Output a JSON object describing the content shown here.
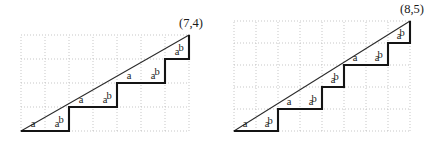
{
  "figure": {
    "background_color": "#ffffff",
    "ink_color": "#1a1a1a",
    "grid_color": "#b9b9b9",
    "panels": [
      {
        "id": "left",
        "corner_label": "(7,4)",
        "grid_cols": 7,
        "grid_rows": 4,
        "origin_x": 21,
        "origin_y": 131,
        "cell_w": 24,
        "cell_h": 24,
        "path_word": "aabaabaabab",
        "steps": [
          {
            "label": "a",
            "dir": "right"
          },
          {
            "label": "a",
            "dir": "right"
          },
          {
            "label": "b",
            "dir": "up"
          },
          {
            "label": "a",
            "dir": "right"
          },
          {
            "label": "a",
            "dir": "right"
          },
          {
            "label": "b",
            "dir": "up"
          },
          {
            "label": "a",
            "dir": "right"
          },
          {
            "label": "a",
            "dir": "right"
          },
          {
            "label": "b",
            "dir": "up"
          },
          {
            "label": "a",
            "dir": "right"
          },
          {
            "label": "b",
            "dir": "up"
          }
        ]
      },
      {
        "id": "right",
        "corner_label": "(8,5)",
        "grid_cols": 8,
        "grid_rows": 5,
        "origin_x": 18,
        "origin_y": 131,
        "cell_w": 22,
        "cell_h": 22,
        "path_word": "aabaababaabab",
        "steps": [
          {
            "label": "a",
            "dir": "right"
          },
          {
            "label": "a",
            "dir": "right"
          },
          {
            "label": "b",
            "dir": "up"
          },
          {
            "label": "a",
            "dir": "right"
          },
          {
            "label": "a",
            "dir": "right"
          },
          {
            "label": "b",
            "dir": "up"
          },
          {
            "label": "a",
            "dir": "right"
          },
          {
            "label": "b",
            "dir": "up"
          },
          {
            "label": "a",
            "dir": "right"
          },
          {
            "label": "a",
            "dir": "right"
          },
          {
            "label": "b",
            "dir": "up"
          },
          {
            "label": "a",
            "dir": "right"
          },
          {
            "label": "b",
            "dir": "up"
          }
        ]
      }
    ]
  }
}
